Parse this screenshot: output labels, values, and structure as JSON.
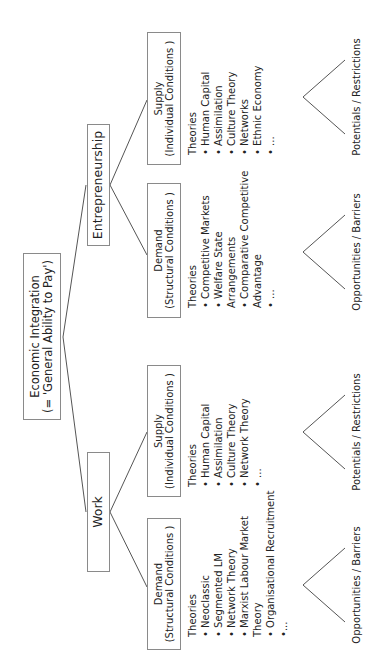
{
  "root": {
    "line1": "Economic Integration",
    "line2": "(= 'General Ability to Pay')"
  },
  "branches": {
    "work": {
      "label": "Work",
      "demand": {
        "title": "Demand",
        "subtitle": "(Structural  Conditions )",
        "theories_header": "Theories",
        "theories": [
          "• Neoclassic",
          "• Segmented LM",
          "• Network Theory",
          "• Marxist Labour Market",
          "Theory",
          "• Organisational Recruitment",
          "•..."
        ],
        "outcome": "Opportunities  / Barriers"
      },
      "supply": {
        "title": "Supply",
        "subtitle": "(Individual Conditions )",
        "theories_header": "Theories",
        "theories": [
          "• Human Capital",
          "• Assimilation",
          "• Culture Theory",
          "• Network Theory",
          "• ..."
        ],
        "outcome": "Potentials  /  Restrictions"
      }
    },
    "entrepreneurship": {
      "label": "Entrepreneurship",
      "demand": {
        "title": "Demand",
        "subtitle": "(Structural  Conditions )",
        "theories_header": "Theories",
        "theories": [
          "• Competitive Markets",
          "• Welfare State",
          "Arrangements",
          "• Comparative Competitive",
          "Advantage",
          "• ..."
        ],
        "outcome": "Opportunities  / Barriers"
      },
      "supply": {
        "title": "Supply",
        "subtitle": "(Individual Conditions )",
        "theories_header": "Theories",
        "theories": [
          "• Human Capital",
          "• Assimilation",
          "• Culture Theory",
          "• Networks",
          "• Ethnic Economy",
          "• ..."
        ],
        "outcome": "Potentials  /  Restrictions"
      }
    }
  },
  "colors": {
    "line": "#555555",
    "border": "#8a8a8a",
    "text": "#222222"
  }
}
